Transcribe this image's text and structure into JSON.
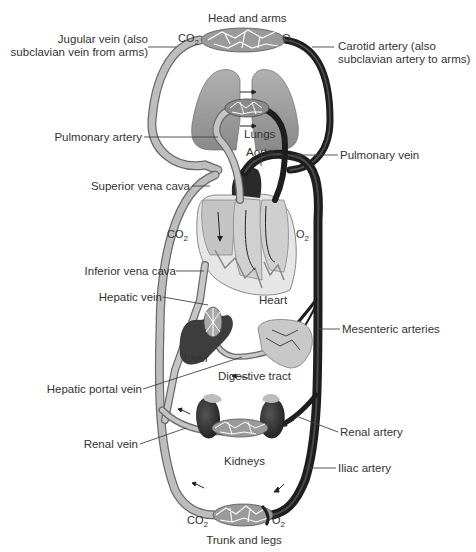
{
  "regions": {
    "top": "Head and arms",
    "bottom": "Trunk and legs"
  },
  "gases": {
    "head_left": {
      "base": "CO",
      "sub": "2"
    },
    "head_right": {
      "base": "O",
      "sub": "2"
    },
    "heart_left": {
      "base": "CO",
      "sub": "2"
    },
    "heart_right": {
      "base": "O",
      "sub": "2"
    },
    "legs_left": {
      "base": "CO",
      "sub": "2"
    },
    "legs_right": {
      "base": "O",
      "sub": "2"
    }
  },
  "labels": {
    "jugular_vein_1": "Jugular vein (also",
    "jugular_vein_2": "subclavian vein from arms)",
    "carotid_artery_1": "Carotid artery (also",
    "carotid_artery_2": "subclavian artery to arms)",
    "pulmonary_artery": "Pulmonary artery",
    "lungs": "Lungs",
    "aorta": "Aorta",
    "pulmonary_vein": "Pulmonary vein",
    "superior_vena_cava": "Superior vena cava",
    "inferior_vena_cava": "Inferior vena cava",
    "hepatic_vein": "Hepatic vein",
    "heart": "Heart",
    "mesenteric_arteries": "Mesenteric arteries",
    "liver": "Liver",
    "digestive_tract": "Digestive tract",
    "hepatic_portal_vein": "Hepatic portal vein",
    "renal_vein": "Renal vein",
    "renal_artery": "Renal artery",
    "kidneys": "Kidneys",
    "iliac_artery": "Iliac artery"
  },
  "colors": {
    "vein": "#a8a8a8",
    "vein_edge": "#6a6a6a",
    "artery": "#1e1e1e",
    "organ": "#9a9a9a",
    "organ_dark": "#3a3a3a",
    "heart_fill": "#d9d9d9",
    "leader": "#444444"
  }
}
